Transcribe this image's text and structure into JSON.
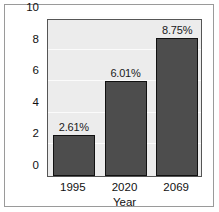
{
  "chart_data": {
    "type": "bar",
    "title": "",
    "subtitle": "",
    "xlabel": "Year",
    "ylabel": "",
    "categories": [
      "1995",
      "2020",
      "2069"
    ],
    "values": [
      2.61,
      6.01,
      8.75
    ],
    "data_labels": [
      "2.61%",
      "6.01%",
      "8.75%"
    ],
    "ylim": [
      0,
      10
    ],
    "xlim": [
      0,
      3
    ],
    "y_ticks": [
      "0",
      "2",
      "4",
      "6",
      "8",
      "10"
    ],
    "y_tick_values": [
      0,
      2,
      4,
      6,
      8,
      10
    ],
    "x_ticks": [
      "1995",
      "2020",
      "2069"
    ],
    "grid": "horizontal",
    "legend": "none",
    "legend_position": "none",
    "series": [
      {
        "name": "",
        "values": [
          2.61,
          6.01,
          8.75
        ]
      }
    ],
    "colors": {
      "bar_fill": "#4d4d4d",
      "bar_edge": "#111111",
      "plot_background": "#ececec",
      "gridline": "#fbfbfb",
      "axis_line": "#555555",
      "frame": "#9a9a9a",
      "text": "#111111",
      "figure_background": "#ffffff"
    }
  }
}
